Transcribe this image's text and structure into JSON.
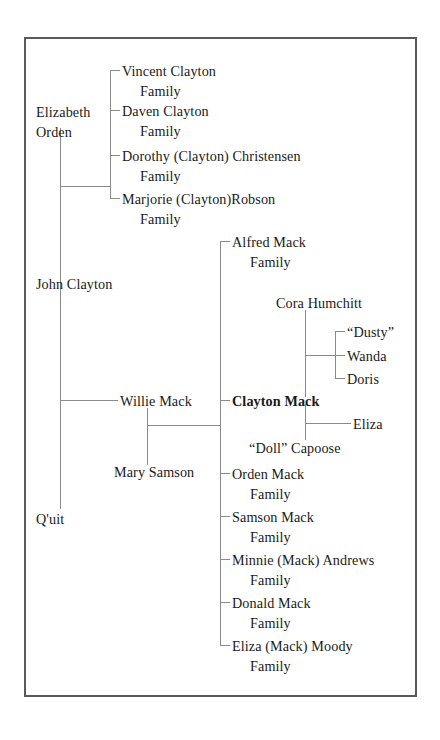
{
  "diagram": {
    "border_color": "#5a5a5a",
    "line_color": "#8a8a8a",
    "text_color": "#1a1a1a",
    "background": "#ffffff"
  },
  "ancestors": {
    "elizabeth_line1": "Elizabeth",
    "elizabeth_line2": "Orden",
    "john_clayton": "John Clayton",
    "quit": "Q'uit"
  },
  "clayton_children": [
    {
      "name": "Vincent Clayton",
      "suffix": "Family"
    },
    {
      "name": "Daven Clayton",
      "suffix": "Family"
    },
    {
      "name": "Dorothy (Clayton) Christensen",
      "suffix": "Family"
    },
    {
      "name": "Marjorie (Clayton)Robson",
      "suffix": "Family"
    }
  ],
  "parents": {
    "willie_mack": "Willie Mack",
    "mary_samson": "Mary Samson"
  },
  "mack_children": [
    {
      "name": "Alfred Mack",
      "suffix": "Family",
      "bold": false
    },
    {
      "name": "Clayton Mack",
      "suffix": "",
      "bold": true
    },
    {
      "name": "Orden Mack",
      "suffix": "Family",
      "bold": false
    },
    {
      "name": "Samson Mack",
      "suffix": "Family",
      "bold": false
    },
    {
      "name": "Minnie (Mack) Andrews",
      "suffix": "Family",
      "bold": false
    },
    {
      "name": "Donald Mack",
      "suffix": "Family",
      "bold": false
    },
    {
      "name": "Eliza (Mack) Moody",
      "suffix": "Family",
      "bold": false
    }
  ],
  "clayton_spouses": {
    "cora_humchitt": "Cora Humchitt",
    "doll_capoose": "“Doll” Capoose"
  },
  "clayton_cora_children": [
    {
      "name": "“Dusty”"
    },
    {
      "name": "Wanda"
    },
    {
      "name": "Doris"
    }
  ],
  "clayton_doll_children": [
    {
      "name": "Eliza"
    }
  ]
}
